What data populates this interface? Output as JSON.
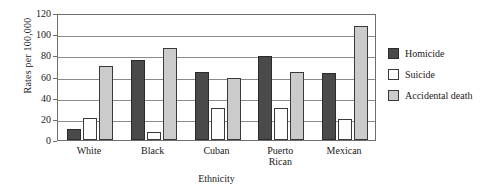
{
  "chart_data": {
    "type": "bar",
    "title": "",
    "xlabel": "Ethnicity",
    "ylabel": "Rates per 100,000",
    "categories": [
      "White",
      "Black",
      "Cuban",
      "Puerto Rican",
      "Mexican"
    ],
    "series": [
      {
        "name": "Homicide",
        "color": "#4a4a4a",
        "values": [
          10,
          76,
          64,
          79,
          63
        ]
      },
      {
        "name": "Suicide",
        "color": "#fdfdfd",
        "values": [
          21,
          8,
          30,
          30,
          20
        ]
      },
      {
        "name": "Accidental death",
        "color": "#cbcbcb",
        "values": [
          70,
          87,
          59,
          64,
          108
        ]
      }
    ],
    "ylim": [
      0,
      120
    ],
    "yticks": [
      0,
      20,
      40,
      60,
      80,
      100,
      120
    ],
    "ytick_labels": [
      "0",
      "20",
      "40",
      "60",
      "80",
      "100",
      "120"
    ],
    "grid": true,
    "legend_position": "right"
  }
}
